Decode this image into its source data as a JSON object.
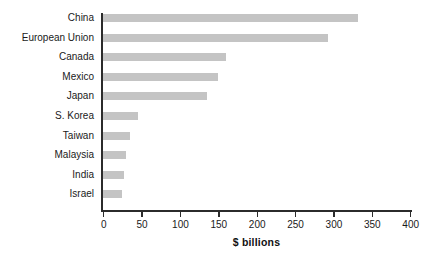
{
  "chart_data": {
    "type": "bar",
    "orientation": "horizontal",
    "title": "",
    "subtitle": "",
    "xlabel": "$ billions",
    "ylabel": "",
    "categories": [
      "China",
      "European Union",
      "Canada",
      "Mexico",
      "Japan",
      "S. Korea",
      "Taiwan",
      "Malaysia",
      "India",
      "Israel"
    ],
    "values": [
      332,
      293,
      160,
      150,
      136,
      46,
      35,
      30,
      27,
      25
    ],
    "xlim": [
      0,
      400
    ],
    "xticks": [
      0,
      50,
      100,
      150,
      200,
      250,
      300,
      350,
      400
    ],
    "xtick_labels": [
      "0",
      "50",
      "100",
      "150",
      "200",
      "250",
      "300",
      "350",
      "400"
    ],
    "grid": false,
    "legend": false,
    "bar_color": "#c4c4c4",
    "axis_color": "#2b2b2b",
    "text_color": "#1a1a1a",
    "background_color": "#ffffff"
  },
  "axis": {
    "x_title": "$ billions"
  }
}
